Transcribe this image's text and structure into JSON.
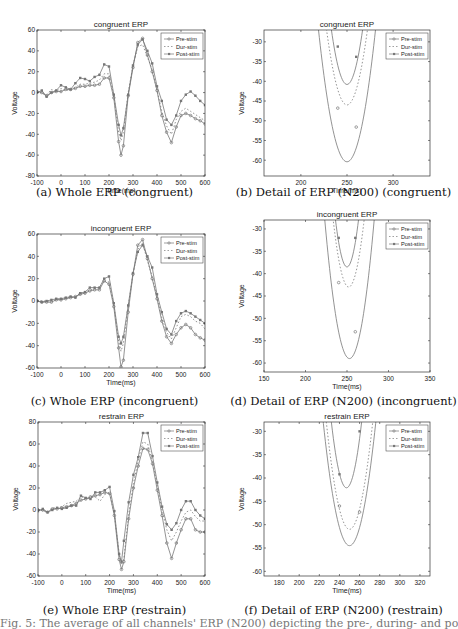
{
  "figure": {
    "caption_partial": "Fig. 5: The average of all channels' ERP (N200) depicting the pre-, during- and post-stimulation"
  },
  "legend": [
    "Pre-stim",
    "Dur-stim",
    "Post-stim"
  ],
  "chart_data": [
    {
      "id": "a",
      "type": "line",
      "title": "congruent ERP",
      "caption": "(a) Whole ERP (congruent)",
      "xlabel": "Time(ms)",
      "ylabel": "Voltage",
      "xlim": [
        -100,
        600
      ],
      "ylim": [
        -80,
        60
      ],
      "xticks": [
        -100,
        0,
        100,
        200,
        300,
        400,
        500,
        600
      ],
      "yticks": [
        -80,
        -60,
        -40,
        -20,
        0,
        20,
        40,
        60
      ],
      "legend_position": "upper right",
      "grid": false,
      "x": [
        -100,
        -80,
        -60,
        -40,
        -20,
        0,
        20,
        40,
        60,
        80,
        100,
        120,
        140,
        160,
        180,
        200,
        220,
        240,
        250,
        260,
        280,
        300,
        320,
        340,
        360,
        380,
        400,
        420,
        440,
        460,
        480,
        500,
        520,
        540,
        560,
        580,
        600
      ],
      "series": [
        {
          "name": "Pre-stim",
          "values": [
            1,
            0,
            -3,
            0,
            1,
            1,
            3,
            3,
            4,
            6,
            6,
            7,
            7,
            8,
            14,
            14,
            -5,
            -47,
            -60,
            -51,
            -3,
            24,
            48,
            52,
            36,
            20,
            2,
            -22,
            -38,
            -48,
            -33,
            -22,
            -20,
            -22,
            -25,
            -27,
            -30
          ]
        },
        {
          "name": "Dur-stim",
          "values": [
            2,
            -1,
            -2,
            3,
            1,
            4,
            2,
            3,
            5,
            8,
            8,
            9,
            10,
            12,
            18,
            18,
            -3,
            -38,
            -46,
            -38,
            0,
            26,
            44,
            46,
            34,
            22,
            2,
            -18,
            -32,
            -40,
            -26,
            -18,
            -15,
            -18,
            -21,
            -24,
            -27
          ]
        },
        {
          "name": "Post-stim",
          "values": [
            0,
            2,
            -4,
            0,
            2,
            7,
            5,
            3,
            9,
            14,
            13,
            11,
            15,
            17,
            27,
            25,
            -2,
            -31,
            -41,
            -34,
            -2,
            26,
            46,
            51,
            40,
            28,
            6,
            -8,
            -26,
            -31,
            -22,
            -8,
            -2,
            1,
            -3,
            -8,
            -12
          ]
        }
      ]
    },
    {
      "id": "b",
      "type": "line",
      "title": "congruent ERP",
      "caption": "(b) Detail of ERP (N200) (congruent)",
      "xlabel": "Time(ms)",
      "ylabel": "Voltage",
      "xlim": [
        160,
        340
      ],
      "ylim": [
        -64,
        -27
      ],
      "xticks": [
        200,
        250,
        300
      ],
      "yticks": [
        -60,
        -55,
        -50,
        -45,
        -40,
        -35,
        -30
      ],
      "legend_position": "upper right",
      "grid": false,
      "series": [
        {
          "name": "Pre-stim",
          "min_x": 250,
          "min_y": -60.4,
          "marker_x": [
            240,
            260
          ],
          "marker_y": [
            -46.8,
            -51.6
          ],
          "halfwidth": 20
        },
        {
          "name": "Dur-stim",
          "min_x": 250,
          "min_y": -46,
          "marker_x": [
            240,
            260
          ],
          "marker_y": [
            -37.5,
            -36
          ],
          "halfwidth": 19
        },
        {
          "name": "Post-stim",
          "min_x": 250,
          "min_y": -40.8,
          "marker_x": [
            240,
            260
          ],
          "marker_y": [
            -31.2,
            -33.8
          ],
          "halfwidth": 17
        }
      ]
    },
    {
      "id": "c",
      "type": "line",
      "title": "incongruent ERP",
      "caption": "(c) Whole ERP (incongruent)",
      "xlabel": "Time(ms)",
      "ylabel": "Voltage",
      "xlim": [
        -100,
        600
      ],
      "ylim": [
        -60,
        60
      ],
      "xticks": [
        -100,
        0,
        100,
        200,
        300,
        400,
        500,
        600
      ],
      "yticks": [
        -60,
        -40,
        -20,
        0,
        20,
        40,
        60
      ],
      "legend_position": "upper right",
      "grid": false,
      "x": [
        -100,
        -80,
        -60,
        -40,
        -20,
        0,
        20,
        40,
        60,
        80,
        100,
        120,
        140,
        160,
        180,
        200,
        220,
        240,
        250,
        260,
        280,
        300,
        320,
        340,
        360,
        380,
        400,
        420,
        440,
        460,
        480,
        500,
        520,
        540,
        560,
        580,
        600
      ],
      "series": [
        {
          "name": "Pre-stim",
          "values": [
            0,
            -1,
            -1,
            -1,
            1,
            1,
            2,
            3,
            4,
            6,
            7,
            9,
            10,
            10,
            18,
            15,
            -5,
            -42,
            -59,
            -53,
            -10,
            24,
            50,
            55,
            38,
            20,
            2,
            -18,
            -32,
            -38,
            -30,
            -24,
            -21,
            -24,
            -30,
            -33,
            -35
          ]
        },
        {
          "name": "Dur-stim",
          "values": [
            1,
            0,
            0,
            0,
            1,
            2,
            3,
            3,
            4,
            7,
            8,
            10,
            11,
            12,
            18,
            17,
            -3,
            -36,
            -45,
            -38,
            -5,
            24,
            46,
            52,
            36,
            22,
            3,
            -15,
            -28,
            -34,
            -24,
            -14,
            -12,
            -14,
            -18,
            -20,
            -25
          ]
        },
        {
          "name": "Post-stim",
          "values": [
            0,
            -1,
            0,
            1,
            2,
            2,
            3,
            4,
            3,
            7,
            8,
            12,
            12,
            12,
            20,
            22,
            -2,
            -32,
            -38,
            -32,
            -4,
            25,
            44,
            50,
            40,
            30,
            6,
            -10,
            -25,
            -30,
            -18,
            -11,
            -9,
            -11,
            -14,
            -17,
            -20
          ]
        }
      ]
    },
    {
      "id": "d",
      "type": "line",
      "title": "incongruent ERP",
      "caption": "(d) Detail of ERP (N200) (incongruent)",
      "xlabel": "Time(ms)",
      "ylabel": "Voltage",
      "xlim": [
        150,
        350
      ],
      "ylim": [
        -62,
        -28
      ],
      "xticks": [
        150,
        200,
        250,
        300,
        350
      ],
      "yticks": [
        -60,
        -55,
        -50,
        -45,
        -40,
        -35,
        -30
      ],
      "legend_position": "upper right",
      "grid": false,
      "series": [
        {
          "name": "Pre-stim",
          "min_x": 253,
          "min_y": -59,
          "marker_x": [
            240,
            260
          ],
          "marker_y": [
            -42,
            -53
          ],
          "halfwidth": 20
        },
        {
          "name": "Dur-stim",
          "min_x": 252,
          "min_y": -43,
          "marker_x": [
            240,
            260
          ],
          "marker_y": [
            -36,
            -35.5
          ],
          "halfwidth": 18
        },
        {
          "name": "Post-stim",
          "min_x": 250,
          "min_y": -38.5,
          "marker_x": [
            240,
            260
          ],
          "marker_y": [
            -32,
            -32
          ],
          "halfwidth": 16
        }
      ]
    },
    {
      "id": "e",
      "type": "line",
      "title": "restrain ERP",
      "caption": "(e) Whole ERP (restrain)",
      "xlabel": "Time(ms)",
      "ylabel": "Voltage",
      "xlim": [
        -100,
        600
      ],
      "ylim": [
        -60,
        80
      ],
      "xticks": [
        -100,
        0,
        100,
        200,
        300,
        400,
        500,
        600
      ],
      "yticks": [
        -60,
        -40,
        -20,
        0,
        20,
        40,
        60,
        80
      ],
      "legend_position": "upper right",
      "grid": false,
      "x": [
        -100,
        -80,
        -60,
        -40,
        -20,
        0,
        20,
        40,
        60,
        80,
        100,
        120,
        140,
        160,
        180,
        200,
        220,
        240,
        250,
        260,
        280,
        300,
        320,
        340,
        360,
        380,
        400,
        420,
        440,
        460,
        480,
        500,
        520,
        540,
        560,
        580,
        600
      ],
      "series": [
        {
          "name": "Pre-stim",
          "values": [
            0,
            0,
            -2,
            1,
            1,
            2,
            3,
            4,
            6,
            9,
            10,
            12,
            13,
            14,
            16,
            15,
            -5,
            -45,
            -54,
            -47,
            -8,
            20,
            40,
            56,
            55,
            42,
            18,
            -5,
            -30,
            -44,
            -30,
            -18,
            -8,
            -8,
            -18,
            -20,
            -20
          ]
        },
        {
          "name": "Dur-stim",
          "values": [
            1,
            -1,
            -2,
            2,
            2,
            3,
            6,
            7,
            8,
            12,
            11,
            11,
            12,
            8,
            14,
            16,
            -4,
            -40,
            -50,
            -44,
            -4,
            24,
            45,
            62,
            60,
            44,
            22,
            0,
            -18,
            -28,
            -20,
            -10,
            -2,
            0,
            -6,
            -10,
            -10
          ]
        },
        {
          "name": "Post-stim",
          "values": [
            -1,
            1,
            -2,
            0,
            2,
            1,
            2,
            4,
            4,
            13,
            11,
            10,
            16,
            16,
            18,
            21,
            -1,
            -40,
            -47,
            -28,
            7,
            32,
            48,
            70,
            70,
            49,
            25,
            3,
            -13,
            -18,
            -12,
            0,
            8,
            8,
            0,
            -5,
            -8
          ]
        }
      ]
    },
    {
      "id": "f",
      "type": "line",
      "title": "restrain ERP",
      "caption": "(f) Detail of ERP (N200) (restrain)",
      "xlabel": "Time(ms)",
      "ylabel": "Voltage",
      "xlim": [
        165,
        330
      ],
      "ylim": [
        -61,
        -28
      ],
      "xticks": [
        180,
        200,
        220,
        240,
        260,
        280,
        300,
        320
      ],
      "yticks": [
        -60,
        -55,
        -50,
        -45,
        -40,
        -35,
        -30
      ],
      "legend_position": "upper right",
      "grid": false,
      "series": [
        {
          "name": "Pre-stim",
          "min_x": 250,
          "min_y": -54.5,
          "marker_x": [
            240,
            260
          ],
          "marker_y": [
            -46,
            -47.3
          ],
          "halfwidth": 19
        },
        {
          "name": "Dur-stim",
          "min_x": 250,
          "min_y": -51,
          "marker_x": [
            240,
            260
          ],
          "marker_y": [
            -44,
            -40.3
          ],
          "halfwidth": 18
        },
        {
          "name": "Post-stim",
          "min_x": 247,
          "min_y": -42.1,
          "marker_x": [
            240,
            260
          ],
          "marker_y": [
            -39.2,
            -30
          ],
          "halfwidth": 15
        }
      ]
    }
  ],
  "layout": {
    "panels": [
      {
        "id": "a",
        "plot": [
          37,
          30,
          168,
          146
        ],
        "caption_y": 180
      },
      {
        "id": "b",
        "plot": [
          264,
          30,
          166,
          146
        ],
        "caption_y": 180
      },
      {
        "id": "c",
        "plot": [
          37,
          234,
          168,
          134
        ],
        "caption_y": 389
      },
      {
        "id": "d",
        "plot": [
          264,
          220,
          166,
          152
        ],
        "caption_y": 389
      },
      {
        "id": "e",
        "plot": [
          38,
          422,
          167,
          154
        ],
        "caption_y": 598
      },
      {
        "id": "f",
        "plot": [
          264,
          422,
          166,
          154
        ],
        "caption_y": 598
      }
    ]
  },
  "style": {
    "line_color": "#777777",
    "axis_color": "#333333",
    "text_color": "#222222"
  }
}
